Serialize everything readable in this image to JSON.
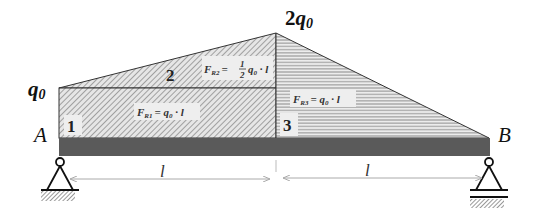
{
  "diagram": {
    "type": "beam-distributed-load",
    "labels": {
      "left_load": "q",
      "left_load_sub": "0",
      "peak_load_coef": "2",
      "peak_load": "q",
      "peak_load_sub": "0",
      "support_left": "A",
      "support_right": "B",
      "span_left": "l",
      "span_right": "l"
    },
    "regions": [
      {
        "id": "1",
        "label": "1",
        "shape": "rectangle",
        "force": {
          "F": "F",
          "sub": "R1",
          "rhs": "= q",
          "rhs_sub": "0",
          "tail": " · l"
        }
      },
      {
        "id": "2",
        "label": "2",
        "shape": "triangle",
        "force": {
          "F": "F",
          "sub": "R2",
          "rhs_pre": "= ",
          "frac_num": "1",
          "frac_den": "2",
          "rhs": "q",
          "rhs_sub": "0",
          "tail": " · l"
        }
      },
      {
        "id": "3",
        "label": "3",
        "shape": "triangle",
        "force": {
          "F": "F",
          "sub": "R3",
          "rhs": "= q",
          "rhs_sub": "0",
          "tail": " · l"
        }
      }
    ],
    "colors": {
      "beam": "#5a5a5a",
      "hatch_diag": "#9a9a9a",
      "hatch_horiz": "#a8a8a8",
      "outline": "#222222",
      "dimension": "#aaaaaa"
    }
  }
}
